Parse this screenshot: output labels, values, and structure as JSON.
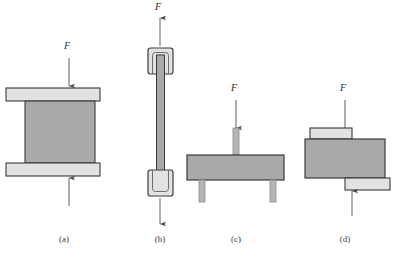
{
  "figure": {
    "type": "diagram",
    "colors": {
      "background": "#ffffff",
      "plate_light": "#e2e2e2",
      "block_medium": "#a9a9a9",
      "outline": "#3a3a3a",
      "arrow": "#4a4a4a",
      "text": "#2b2b2b"
    },
    "panels": [
      {
        "id": "a",
        "caption": "(a)",
        "mode": "compression",
        "force_label": "F",
        "arrows": [
          {
            "name": "top-force-arrow",
            "direction": "down"
          },
          {
            "name": "bottom-force-arrow",
            "direction": "up"
          }
        ],
        "parts": [
          "top-plate",
          "center-block",
          "bottom-plate"
        ]
      },
      {
        "id": "b",
        "caption": "(b)",
        "mode": "tension",
        "force_label": "F",
        "arrows": [
          {
            "name": "top-force-arrow",
            "direction": "up"
          },
          {
            "name": "bottom-force-arrow",
            "direction": "down"
          }
        ],
        "parts": [
          "top-grip",
          "specimen-bar",
          "bottom-grip"
        ]
      },
      {
        "id": "c",
        "caption": "(c)",
        "mode": "bending",
        "force_label": "F",
        "arrows": [
          {
            "name": "top-force-arrow",
            "direction": "down"
          }
        ],
        "parts": [
          "punch",
          "beam",
          "left-support",
          "right-support"
        ]
      },
      {
        "id": "d",
        "caption": "(d)",
        "mode": "shear",
        "force_label": "F",
        "arrows": [
          {
            "name": "top-force-arrow",
            "direction": "down"
          },
          {
            "name": "bottom-force-arrow",
            "direction": "up"
          }
        ],
        "parts": [
          "upper-plate",
          "center-block",
          "lower-plate"
        ]
      }
    ],
    "captions": {
      "a": "(a)",
      "b": "(b)",
      "c": "(c)",
      "d": "(d)"
    },
    "force_labels": {
      "a": "F",
      "b_top": "F",
      "c": "F",
      "d": "F"
    }
  }
}
